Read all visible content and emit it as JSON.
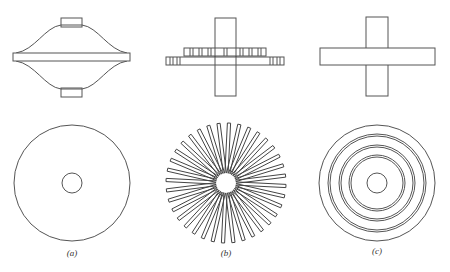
{
  "figure": {
    "panels": [
      {
        "id": "a",
        "label": "(a)",
        "label_x": 72,
        "side_view": "disc with bell-shaped hub and shaft caps",
        "top_view": "plain disc with central hole",
        "center": [
          72,
          183
        ],
        "outer_radius": 58,
        "hole_radius": 10
      },
      {
        "id": "b",
        "label": "(b)",
        "label_x": 226,
        "side_view": "shaft with stacked slotted rings",
        "top_view": "radial spokes around central hole",
        "center": [
          226,
          183
        ],
        "outer_radius": 60,
        "hole_radius": 10,
        "spoke_count": 36
      },
      {
        "id": "c",
        "label": "(c)",
        "label_x": 377,
        "side_view": "shaft through flat disc",
        "top_view": "concentric double rings around central hole",
        "center": [
          377,
          183
        ],
        "outer_radius": 58,
        "hole_radius": 10,
        "double_rings": [
          [
            49,
            47
          ],
          [
            38,
            36
          ],
          [
            28,
            26
          ]
        ]
      }
    ],
    "colors": {
      "line": "#555555",
      "background": "#ffffff"
    }
  }
}
